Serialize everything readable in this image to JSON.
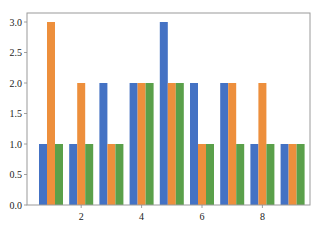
{
  "chart_data": {
    "type": "bar",
    "title": "",
    "xlabel": "",
    "ylabel": "",
    "x": [
      1,
      2,
      3,
      4,
      5,
      6,
      7,
      8,
      9
    ],
    "series": [
      {
        "name": "series-1",
        "color": "#4472c4",
        "values": [
          1,
          1,
          2,
          2,
          3,
          2,
          2,
          1,
          1
        ]
      },
      {
        "name": "series-2",
        "color": "#ed8f3c",
        "values": [
          3,
          2,
          1,
          2,
          2,
          1,
          2,
          2,
          1
        ]
      },
      {
        "name": "series-3",
        "color": "#5aa04a",
        "values": [
          1,
          1,
          1,
          2,
          2,
          1,
          1,
          1,
          1
        ]
      }
    ],
    "xticks": [
      2,
      4,
      6,
      8
    ],
    "xtick_labels": [
      "2",
      "4",
      "6",
      "8"
    ],
    "yticks": [
      0.0,
      0.5,
      1.0,
      1.5,
      2.0,
      2.5,
      3.0
    ],
    "ytick_labels": [
      "0.0",
      "0.5",
      "1.0",
      "1.5",
      "2.0",
      "2.5",
      "3.0"
    ],
    "ylim": [
      0,
      3.2
    ],
    "xlim": [
      0.2,
      9.6
    ],
    "grid": false,
    "legend": null
  }
}
